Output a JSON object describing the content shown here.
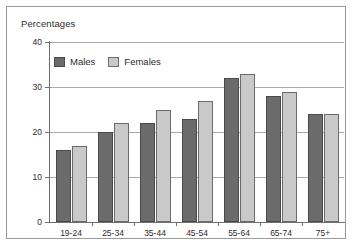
{
  "figure": {
    "title": "Percentages"
  },
  "legend": {
    "position": "top-left-inside",
    "items": [
      {
        "label": "Males",
        "color": "#6b6b6b",
        "swatch_name": "legend-swatch-males"
      },
      {
        "label": "Females",
        "color": "#c9c9c9",
        "swatch_name": "legend-swatch-females"
      }
    ]
  },
  "axes": {
    "y_ticks": [
      "0",
      "10",
      "20",
      "30",
      "40"
    ],
    "x_ticks": [
      "19-24",
      "25-34",
      "35-44",
      "45-54",
      "55-64",
      "65-74",
      "75+"
    ]
  },
  "colors": {
    "males": "#6b6b6b",
    "females": "#c9c9c9",
    "gridline": "#a9a9a9",
    "axis": "#6f6f6f",
    "frame": "#9a9a9a",
    "text": "#2b2b2b"
  },
  "chart_data": {
    "type": "bar",
    "title": "Percentages",
    "xlabel": "",
    "ylabel": "Percentages",
    "ylim": [
      0,
      40
    ],
    "yticks": [
      0,
      10,
      20,
      30,
      40
    ],
    "grid": true,
    "legend_position": "upper left",
    "categories": [
      "19-24",
      "25-34",
      "35-44",
      "45-54",
      "55-64",
      "65-74",
      "75+"
    ],
    "series": [
      {
        "name": "Males",
        "color": "#6b6b6b",
        "values": [
          16,
          20,
          22,
          23,
          32,
          28,
          24
        ]
      },
      {
        "name": "Females",
        "color": "#c9c9c9",
        "values": [
          17,
          22,
          25,
          27,
          33,
          29,
          24
        ]
      }
    ]
  }
}
